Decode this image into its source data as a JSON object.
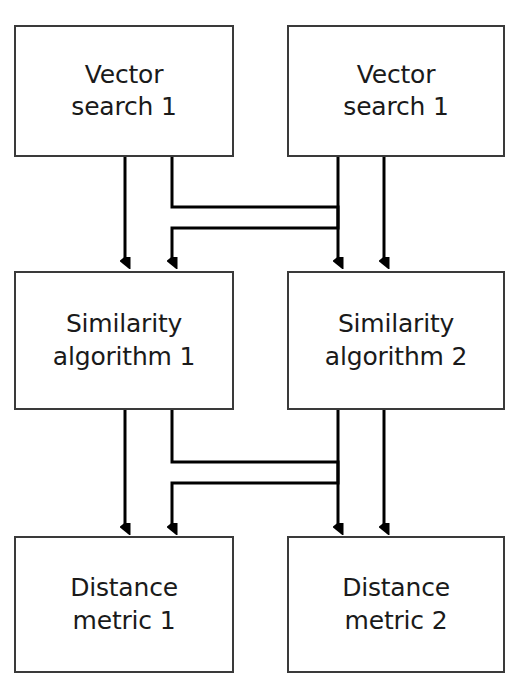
{
  "diagram": {
    "canvas": {
      "width": 519,
      "height": 685
    },
    "style": {
      "box_border_color": "#3a3a3a",
      "box_fill_color": "#ffffff",
      "connector_color": "#000000",
      "text_color": "#1a1a1a",
      "background_color": "#ffffff",
      "box_border_width": 2,
      "connector_width": 3
    },
    "rows": [
      {
        "name": "vector-search-row",
        "nodes": [
          {
            "id": "vector-search-left",
            "label": "Vector\nsearch 1",
            "x": 14,
            "y": 25,
            "w": 220,
            "h": 132
          },
          {
            "id": "vector-search-right",
            "label": "Vector\nsearch 1",
            "x": 287,
            "y": 25,
            "w": 218,
            "h": 132
          }
        ]
      },
      {
        "name": "similarity-algorithm-row",
        "nodes": [
          {
            "id": "similarity-algorithm-1",
            "label": "Similarity\nalgorithm 1",
            "x": 14,
            "y": 271,
            "w": 220,
            "h": 139
          },
          {
            "id": "similarity-algorithm-2",
            "label": "Similarity\nalgorithm 2",
            "x": 287,
            "y": 271,
            "w": 218,
            "h": 139
          }
        ]
      },
      {
        "name": "distance-metric-row",
        "nodes": [
          {
            "id": "distance-metric-1",
            "label": "Distance\nmetric 1",
            "x": 14,
            "y": 536,
            "w": 220,
            "h": 137
          },
          {
            "id": "distance-metric-2",
            "label": "Distance\nmetric 2",
            "x": 287,
            "y": 536,
            "w": 218,
            "h": 137
          }
        ]
      }
    ],
    "connectors": [
      {
        "id": "vs1-to-sa1",
        "type": "straight",
        "from": "vector-search-left",
        "to": "similarity-algorithm-1",
        "x": 125
      },
      {
        "id": "vs1-to-sa2",
        "type": "crossing",
        "from": "vector-search-left",
        "to": "similarity-algorithm-2",
        "start_x": 172,
        "end_x": 338,
        "elbow_y": 207
      },
      {
        "id": "vs2-to-sa1",
        "type": "crossing",
        "from": "vector-search-right",
        "to": "similarity-algorithm-1",
        "start_x": 338,
        "end_x": 172,
        "elbow_y": 228
      },
      {
        "id": "vs2-to-sa2",
        "type": "straight",
        "from": "vector-search-right",
        "to": "similarity-algorithm-2",
        "x": 384
      },
      {
        "id": "sa1-to-dm1",
        "type": "straight",
        "from": "similarity-algorithm-1",
        "to": "distance-metric-1",
        "x": 125
      },
      {
        "id": "sa1-to-dm2",
        "type": "crossing",
        "from": "similarity-algorithm-1",
        "to": "distance-metric-2",
        "start_x": 172,
        "end_x": 338,
        "elbow_y": 462
      },
      {
        "id": "sa2-to-dm1",
        "type": "crossing",
        "from": "similarity-algorithm-2",
        "to": "distance-metric-1",
        "start_x": 338,
        "end_x": 172,
        "elbow_y": 483
      },
      {
        "id": "sa2-to-dm2",
        "type": "straight",
        "from": "similarity-algorithm-2",
        "to": "distance-metric-2",
        "x": 384
      }
    ]
  }
}
